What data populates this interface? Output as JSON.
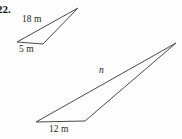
{
  "problem": {
    "number": "22."
  },
  "figure": {
    "small_triangle": {
      "points": "17,42 43,44 78,8",
      "side_label": "18 m",
      "base_label": "5 m"
    },
    "large_triangle": {
      "points": "36,122 85,121 176,43",
      "side_label": "n",
      "base_label": "12 m"
    }
  },
  "colors": {
    "line": "#4a4a4a",
    "text": "#1f1f1f",
    "background": "#fdfdfd"
  }
}
